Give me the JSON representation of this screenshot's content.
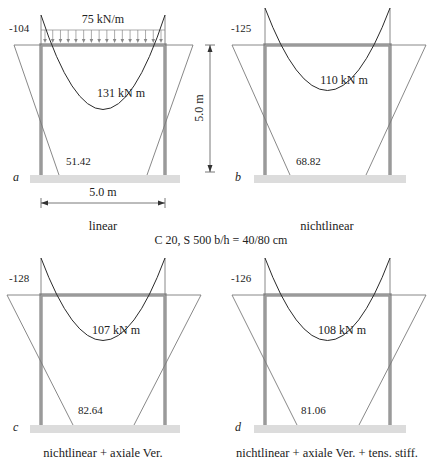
{
  "colors": {
    "frame": "#9a9a9a",
    "moment_line": "#2a2a2a",
    "thin_line": "#7a7a7a",
    "ground": "#dcdcdc",
    "text": "#222222"
  },
  "load": {
    "label": "75 kN/m",
    "arrows": 16
  },
  "dimensions": {
    "height_label": "5.0 m",
    "span_label": "5.0 m"
  },
  "section_label": "C 20, S 500 b/h = 40/80 cm",
  "panels": [
    {
      "id": "a",
      "letter": "a",
      "caption": "linear",
      "corner_moment": "-104",
      "span_moment": "131 kN m",
      "base_moment": "51.42",
      "geom": {
        "ox": 0,
        "oy": 0,
        "colL": 41,
        "colR": 165,
        "beamY": 45,
        "baseY": 175,
        "tipY": 15,
        "outL": 14,
        "outR": 193,
        "footL": 59,
        "footR": 147,
        "sagY": 78,
        "groundX1": 30,
        "groundX2": 180
      }
    },
    {
      "id": "b",
      "letter": "b",
      "caption": "nichtlinear",
      "corner_moment": "-125",
      "span_moment": "110 kN m",
      "base_moment": "68.82",
      "geom": {
        "ox": 224,
        "oy": 0,
        "colL": 41,
        "colR": 166,
        "beamY": 45,
        "baseY": 175,
        "tipY": 8,
        "outL": 8,
        "outR": 202,
        "footL": 66,
        "footR": 142,
        "sagY": 63,
        "groundX1": 30,
        "groundX2": 182
      }
    },
    {
      "id": "c",
      "letter": "c",
      "caption": "nichtlinear + axiale Ver.",
      "corner_moment": "-128",
      "span_moment": "107 kN m",
      "base_moment": "82.64",
      "geom": {
        "ox": 0,
        "oy": 250,
        "colL": 41,
        "colR": 165,
        "beamY": 45,
        "baseY": 175,
        "tipY": 8,
        "outL": 7,
        "outR": 201,
        "footL": 73,
        "footR": 134,
        "sagY": 63,
        "groundX1": 30,
        "groundX2": 180
      }
    },
    {
      "id": "d",
      "letter": "d",
      "caption": "nichtlinear + axiale Ver. + tens. stiff.",
      "corner_moment": "-126",
      "span_moment": "108 kN m",
      "base_moment": "81.06",
      "geom": {
        "ox": 224,
        "oy": 250,
        "colL": 41,
        "colR": 166,
        "beamY": 45,
        "baseY": 175,
        "tipY": 8,
        "outL": 8,
        "outR": 202,
        "footL": 73,
        "footR": 135,
        "sagY": 63,
        "groundX1": 30,
        "groundX2": 182
      }
    }
  ]
}
